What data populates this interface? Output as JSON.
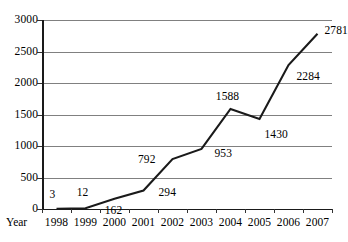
{
  "chart_data": {
    "type": "line",
    "title": "",
    "subtitle": "",
    "xlabel": "Year",
    "ylabel": "",
    "categories": [
      "1998",
      "1999",
      "2000",
      "2001",
      "2002",
      "2003",
      "2004",
      "2005",
      "2006",
      "2007"
    ],
    "values": [
      3,
      12,
      162,
      294,
      792,
      953,
      1588,
      1430,
      2284,
      2781
    ],
    "series": [
      {
        "name": "",
        "values": [
          3,
          12,
          162,
          294,
          792,
          953,
          1588,
          1430,
          2284,
          2781
        ]
      }
    ],
    "point_labels": [
      "3",
      "12",
      "162",
      "294",
      "792",
      "953",
      "1588",
      "1430",
      "2284",
      "2781"
    ],
    "ylim": [
      0,
      3000
    ],
    "ytick_values": [
      0,
      500,
      1000,
      1500,
      2000,
      2500,
      3000
    ],
    "ytick_labels": [
      "0",
      "500",
      "1000",
      "1500",
      "2000",
      "2500",
      "3000"
    ],
    "grid": true,
    "grid_axis": "y",
    "legend": false,
    "legend_position": "none",
    "markers": false
  },
  "style": {
    "line_color": "#1a1a1a",
    "grid_color": "#808080",
    "axis_color": "#1a1a1a",
    "text_color": "#000000",
    "background": "#ffffff"
  },
  "label_offsets": [
    {
      "dx": -4,
      "dy": -15,
      "anchor": "middle"
    },
    {
      "dx": -3,
      "dy": -16,
      "anchor": "middle"
    },
    {
      "dx": -1,
      "dy": 11,
      "anchor": "middle"
    },
    {
      "dx": 15,
      "dy": 2,
      "anchor": "start"
    },
    {
      "dx": -17,
      "dy": 0,
      "anchor": "end"
    },
    {
      "dx": 13,
      "dy": 4,
      "anchor": "start"
    },
    {
      "dx": -3,
      "dy": -13,
      "anchor": "middle"
    },
    {
      "dx": 5,
      "dy": 15,
      "anchor": "start"
    },
    {
      "dx": 8,
      "dy": 11,
      "anchor": "start"
    },
    {
      "dx": 7,
      "dy": -4,
      "anchor": "start"
    }
  ]
}
